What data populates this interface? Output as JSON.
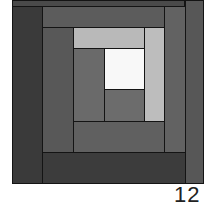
{
  "diagram": {
    "type": "log-cabin-quilt-block",
    "label": "12",
    "pieces": [
      {
        "name": "top-outer-strip",
        "x": 12,
        "y": 0,
        "w": 173,
        "h": 7,
        "color": "#4a4a4a"
      },
      {
        "name": "right-outer-strip",
        "x": 185,
        "y": 0,
        "w": 19,
        "h": 184,
        "color": "#575757"
      },
      {
        "name": "left-outer-strip",
        "x": 12,
        "y": 6,
        "w": 31,
        "h": 178,
        "color": "#3a3a3a"
      },
      {
        "name": "bottom-outer-strip",
        "x": 42,
        "y": 152,
        "w": 144,
        "h": 32,
        "color": "#3c3c3c"
      },
      {
        "name": "top-second-strip",
        "x": 42,
        "y": 6,
        "w": 123,
        "h": 22,
        "color": "#5c5c5c"
      },
      {
        "name": "right-second-strip",
        "x": 164,
        "y": 6,
        "w": 22,
        "h": 147,
        "color": "#626262"
      },
      {
        "name": "left-second-strip",
        "x": 42,
        "y": 27,
        "w": 32,
        "h": 126,
        "color": "#585858"
      },
      {
        "name": "bottom-second-strip",
        "x": 73,
        "y": 121,
        "w": 92,
        "h": 32,
        "color": "#606060"
      },
      {
        "name": "top-light-strip",
        "x": 73,
        "y": 27,
        "w": 72,
        "h": 22,
        "color": "#b9b9b9"
      },
      {
        "name": "right-light-strip",
        "x": 144,
        "y": 27,
        "w": 21,
        "h": 95,
        "color": "#bdbdbd"
      },
      {
        "name": "left-inner-strip",
        "x": 73,
        "y": 48,
        "w": 32,
        "h": 74,
        "color": "#6a6a6a"
      },
      {
        "name": "center-square",
        "x": 104,
        "y": 48,
        "w": 41,
        "h": 42,
        "color": "#f8f8f8"
      },
      {
        "name": "center-bottom-strip",
        "x": 104,
        "y": 89,
        "w": 41,
        "h": 33,
        "color": "#6c6c6c"
      }
    ]
  }
}
